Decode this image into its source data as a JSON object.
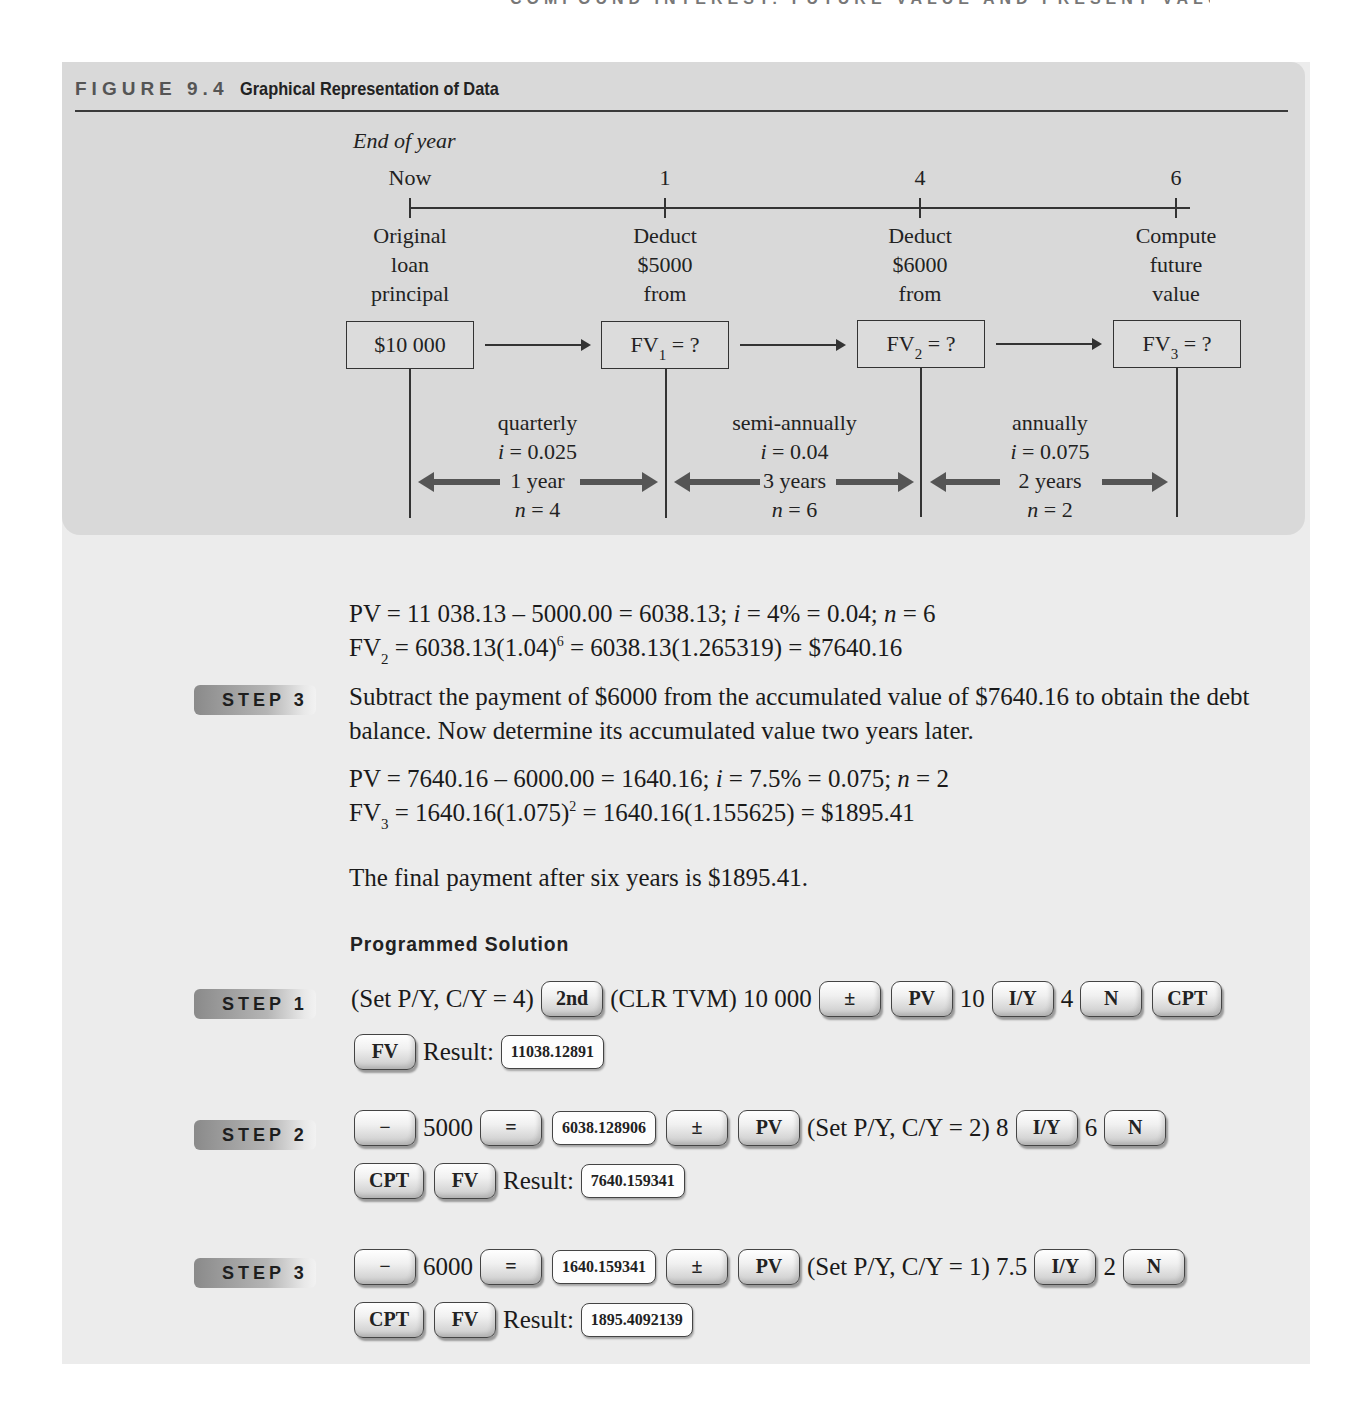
{
  "running_head": "COMPOUND INTEREST: FUTURE VALUE AND PRESENT VALUE",
  "figure": {
    "number": "FIGURE 9.4",
    "title": "Graphical Representation of Data",
    "axis_label": "End of year",
    "timeline": [
      {
        "tick": "Now",
        "desc": [
          "Original",
          "loan",
          "principal"
        ],
        "box": "$10 000"
      },
      {
        "tick": "1",
        "desc": [
          "Deduct",
          "$5000",
          "from"
        ],
        "box_main": "FV",
        "box_sub": "1",
        "box_rest": " = ?"
      },
      {
        "tick": "4",
        "desc": [
          "Deduct",
          "$6000",
          "from"
        ],
        "box_main": "FV",
        "box_sub": "2",
        "box_rest": " = ?"
      },
      {
        "tick": "6",
        "desc": [
          "Compute",
          "future",
          "value"
        ],
        "box_main": "FV",
        "box_sub": "3",
        "box_rest": " = ?"
      }
    ],
    "intervals": [
      {
        "freq": "quarterly",
        "rate": "= 0.025",
        "term": "1 year",
        "n": "= 4"
      },
      {
        "freq": "semi-annually",
        "rate": "= 0.04",
        "term": "3 years",
        "n": "= 6"
      },
      {
        "freq": "annually",
        "rate": "= 0.075",
        "term": "2 years",
        "n": "= 2"
      }
    ]
  },
  "step2_calc": {
    "line1": "PV = 11 038.13 – 5000.00 = 6038.13; ",
    "line1_i": "i",
    "line1_b": " = 4% = 0.04; ",
    "line1_n": "n",
    "line1_c": " = 6",
    "line2_a": "FV",
    "line2_sub": "2",
    "line2_b": " = 6038.13(1.04)",
    "line2_sup": "6",
    "line2_c": " = 6038.13(1.265319) = $7640.16"
  },
  "step3": {
    "badge": "STEP 3",
    "text": "Subtract the payment of $6000 from the accumulated value of $7640.16 to obtain the debt balance. Now determine its accumulated value two years later.",
    "line1": "PV = 7640.16 – 6000.00 = 1640.16; ",
    "line1_i": "i",
    "line1_b": " = 7.5% = 0.075; ",
    "line1_n": "n",
    "line1_c": " = 2",
    "line2_a": "FV",
    "line2_sub": "3",
    "line2_b": " = 1640.16(1.075)",
    "line2_sup": "2",
    "line2_c": " = 1640.16(1.155625) = $1895.41",
    "conclusion": "The final payment after six years is $1895.41."
  },
  "programmed": {
    "heading": "Programmed Solution",
    "step1": {
      "badge": "STEP 1",
      "t1": "(Set P/Y, C/Y = 4)",
      "k_2nd": "2nd",
      "t2": "(CLR TVM) 10 000",
      "k_pm": "±",
      "k_pv": "PV",
      "t3": "10",
      "k_iy": "I/Y",
      "t4": "4",
      "k_n": "N",
      "k_cpt": "CPT",
      "k_fv": "FV",
      "result_label": "Result:",
      "result": "11038.12891"
    },
    "step2": {
      "badge": "STEP 2",
      "k_minus": "−",
      "t1": "5000",
      "k_eq": "=",
      "display": "6038.128906",
      "k_pm": "±",
      "k_pv": "PV",
      "t2": "(Set P/Y, C/Y = 2) 8",
      "k_iy": "I/Y",
      "t3": "6",
      "k_n": "N",
      "k_cpt": "CPT",
      "k_fv": "FV",
      "result_label": "Result:",
      "result": "7640.159341"
    },
    "step3": {
      "badge": "STEP 3",
      "k_minus": "−",
      "t1": "6000",
      "k_eq": "=",
      "display": "1640.159341",
      "k_pm": "±",
      "k_pv": "PV",
      "t2": "(Set P/Y, C/Y = 1) 7.5",
      "k_iy": "I/Y",
      "t3": "2",
      "k_n": "N",
      "k_cpt": "CPT",
      "k_fv": "FV",
      "result_label": "Result:",
      "result": "1895.4092139"
    }
  }
}
